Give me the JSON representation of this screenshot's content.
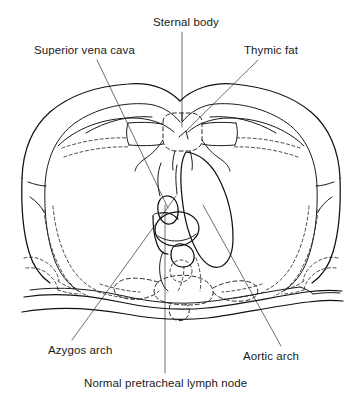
{
  "figure": {
    "type": "anatomical-line-drawing",
    "background_color": "#ffffff",
    "ink_color": "#111111",
    "leader_color": "#555555"
  },
  "labels": {
    "sternal_body": "Sternal body",
    "superior_vena_cava": "Superior vena cava",
    "thymic_fat": "Thymic fat",
    "azygos_arch": "Azygos arch",
    "aortic_arch": "Aortic arch",
    "normal_pretracheal_lymph_node": "Normal pretracheal lymph node"
  },
  "structures": [
    {
      "name": "chest-wall-outline",
      "style": "solid"
    },
    {
      "name": "pleural-lung-outline",
      "style": "solid"
    },
    {
      "name": "sternal-body",
      "style": "dashed"
    },
    {
      "name": "thymic-fat-region",
      "style": "solid"
    },
    {
      "name": "superior-vena-cava",
      "style": "solid"
    },
    {
      "name": "aortic-arch",
      "style": "solid"
    },
    {
      "name": "azygos-arch",
      "style": "solid"
    },
    {
      "name": "trachea",
      "style": "solid"
    },
    {
      "name": "pretracheal-lymph-node",
      "style": "solid"
    },
    {
      "name": "vertebral-body",
      "style": "dashed"
    },
    {
      "name": "scapulae-and-ribs",
      "style": "dashed"
    },
    {
      "name": "posterior-back-musculature",
      "style": "solid"
    }
  ]
}
